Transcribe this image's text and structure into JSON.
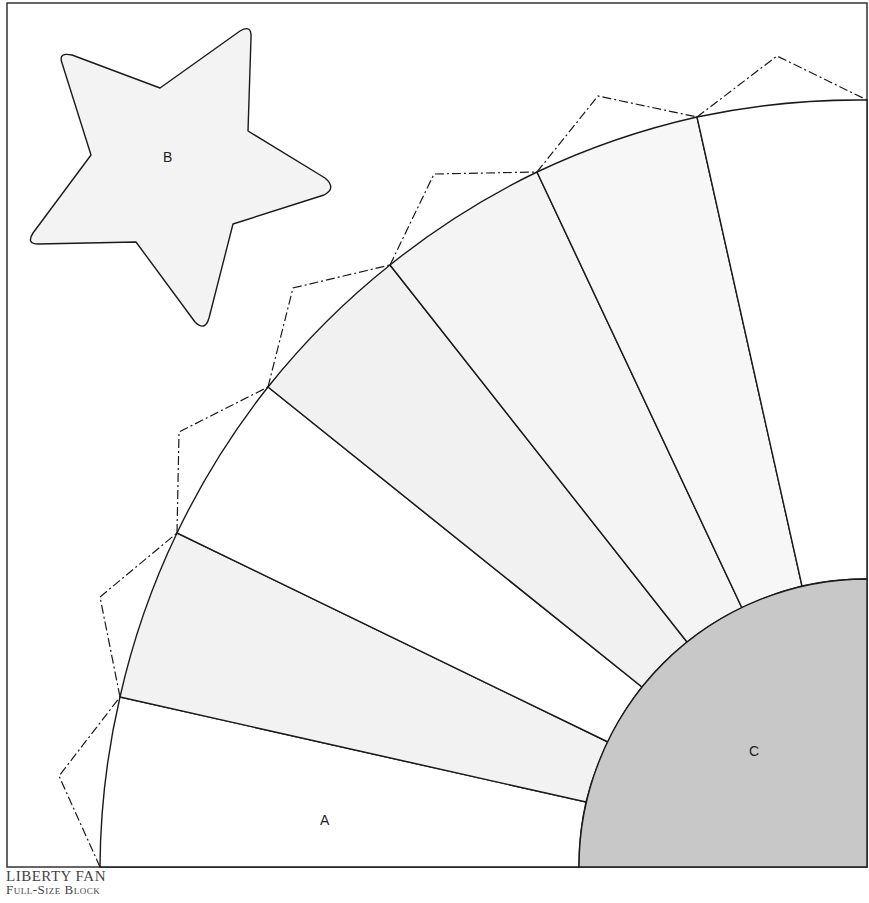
{
  "caption": {
    "title": "LIBERTY FAN",
    "subtitle": "Full-Size Block"
  },
  "pieces": {
    "a": {
      "label": "A",
      "name": "fan blade"
    },
    "b": {
      "label": "B",
      "name": "star"
    },
    "c": {
      "label": "C",
      "name": "quarter circle center"
    }
  },
  "colors": {
    "outline": "#1a1a1a",
    "blade_light": "#f2f2f2",
    "blade_white": "#ffffff",
    "star_fill": "#f3f3f3",
    "center_fill": "#c8c8c8"
  },
  "geometry": {
    "frame": [
      7,
      3,
      867,
      867
    ],
    "fan_center": [
      867,
      867
    ],
    "outer_radius": 767,
    "inner_radius": 288,
    "blade_count": 7
  }
}
